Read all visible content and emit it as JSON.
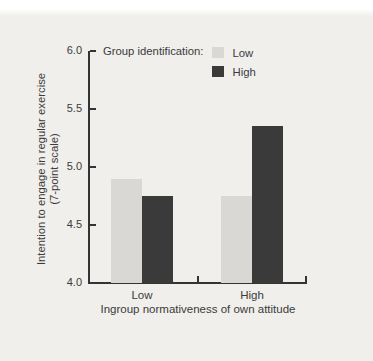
{
  "page": {
    "background_color": "#f0efec",
    "text_color": "#3b3b3b",
    "axis_color": "#343434"
  },
  "chart_data": {
    "type": "bar",
    "title": "",
    "categories": [
      "Low",
      "High"
    ],
    "series": [
      {
        "name": "Low",
        "color": "#d9d8d4",
        "values": [
          4.9,
          4.75
        ]
      },
      {
        "name": "High",
        "color": "#3a3a3a",
        "values": [
          4.75,
          5.35
        ]
      }
    ],
    "legend_title": "Group identification:",
    "legend_position": "top-inside",
    "xlabel": "Ingroup normativeness of own attitude",
    "ylabel_line1": "Intention to engage in regular exercise",
    "ylabel_line2": "(7-point scale)",
    "ylim": [
      4.0,
      6.0
    ],
    "yticks": [
      4.0,
      4.5,
      5.0,
      5.5,
      6.0
    ],
    "ytick_labels": [
      "4.0",
      "4.5",
      "5.0",
      "5.5",
      "6.0"
    ],
    "grid": false
  }
}
